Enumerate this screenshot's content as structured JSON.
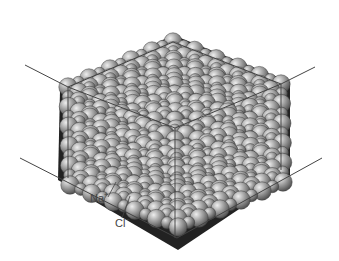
{
  "diagram": {
    "labels": [
      {
        "id": "na",
        "text": "Na",
        "charge": "+",
        "x": 90,
        "y": 197
      },
      {
        "id": "cl",
        "text": "Cl",
        "charge": "−",
        "x": 115,
        "y": 222
      }
    ],
    "leader_lines": [
      {
        "for": "na",
        "x1": 108,
        "y1": 197,
        "x2": 116,
        "y2": 182
      },
      {
        "for": "cl",
        "x1": 122,
        "y1": 218,
        "x2": 130,
        "y2": 196
      }
    ],
    "colors": {
      "sphere_light": "#d8d8d8",
      "sphere_mid": "#9a9a9a",
      "sphere_dark": "#5a5a5a",
      "void": "#1e1e1e",
      "line": "#444444"
    },
    "cube_lines": [
      [
        25,
        65,
        68,
        87
      ],
      [
        68,
        87,
        173,
        42
      ],
      [
        173,
        42,
        281,
        84
      ],
      [
        281,
        84,
        315,
        67
      ],
      [
        68,
        87,
        175,
        128
      ],
      [
        175,
        128,
        281,
        84
      ],
      [
        68,
        87,
        68,
        178
      ],
      [
        281,
        84,
        281,
        170
      ],
      [
        175,
        128,
        175,
        238
      ],
      [
        20,
        158,
        177,
        238
      ],
      [
        177,
        238,
        322,
        158
      ]
    ]
  }
}
